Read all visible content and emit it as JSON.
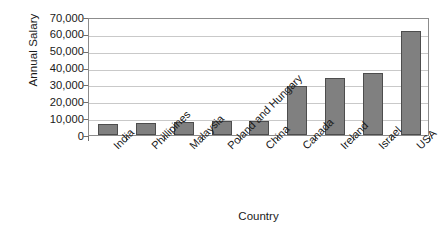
{
  "chart_data": {
    "type": "bar",
    "title": "",
    "xlabel": "Country",
    "ylabel": "Annual Salary",
    "categories": [
      "India",
      "Phillipines",
      "Malaysia",
      "Poland and Hungary",
      "China",
      "Canada",
      "Ireland",
      "Israel",
      "USA"
    ],
    "values": [
      6500,
      7000,
      7500,
      8500,
      8500,
      29000,
      34000,
      36500,
      62000
    ],
    "ylim": [
      0,
      70000
    ],
    "ytick_values": [
      0,
      10000,
      20000,
      30000,
      40000,
      50000,
      60000,
      70000
    ],
    "ytick_labels": [
      "0",
      "10,000",
      "20,000",
      "30,000",
      "40,000",
      "50,000",
      "60,000",
      "70,000"
    ],
    "grid": true,
    "legend": false,
    "legend_position": "none",
    "bar_color": "#808080",
    "bar_edge_color": "#4d4d4d",
    "gridline_color": "#c9c9c9",
    "axis_color": "#8c8c8c",
    "background_color": "#ffffff",
    "xtick_label_rotation": -45
  }
}
